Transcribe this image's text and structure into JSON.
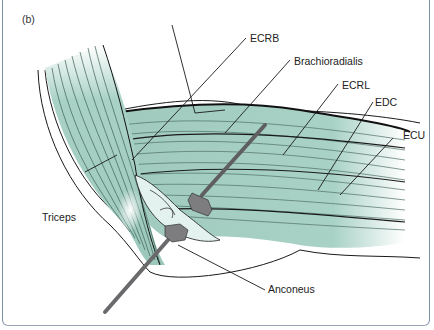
{
  "figure": {
    "panel_label": "(b)",
    "colors": {
      "muscle_fill": "#a9d2c7",
      "muscle_light": "#e3f2ee",
      "fiber_line": "#4f6f66",
      "outline": "#1a1a1a",
      "retractor": "#7d7d80",
      "frame": "#7d8fa6"
    },
    "labels": {
      "ecrb": "ECRB",
      "brachioradialis": "Brachioradialis",
      "ecrl": "ECRL",
      "edc": "EDC",
      "ecu": "ECU",
      "triceps": "Triceps",
      "anconeus": "Anconeus"
    }
  }
}
